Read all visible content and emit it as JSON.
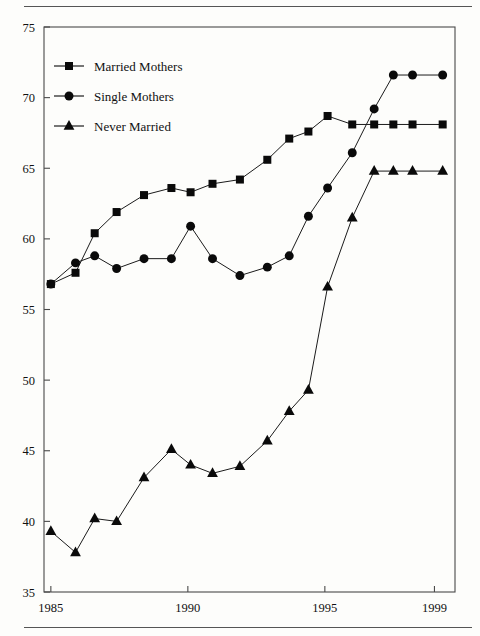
{
  "figure": {
    "top_rule": true,
    "bottom_rule": true,
    "caption": ""
  },
  "chart_data": {
    "type": "line",
    "title": "",
    "xlabel": "",
    "ylabel": "",
    "xlim": [
      1984.75,
      1999.75
    ],
    "ylim": [
      35,
      75
    ],
    "ytick_values": [
      35,
      40,
      45,
      50,
      55,
      60,
      65,
      70,
      75
    ],
    "ytick_labels": [
      "35",
      "40",
      "45",
      "50",
      "55",
      "60",
      "65",
      "70",
      "75"
    ],
    "xtick_values": [
      1985,
      1990,
      1995,
      1999
    ],
    "xtick_labels": [
      "1985",
      "1990",
      "1995",
      "1999"
    ],
    "grid": false,
    "legend_position": "upper-left",
    "series": [
      {
        "name": "Married Mothers",
        "marker": "square",
        "x": [
          1985.0,
          1985.9,
          1986.6,
          1987.4,
          1988.4,
          1989.4,
          1990.1,
          1990.9,
          1991.9,
          1992.9,
          1993.7,
          1994.4,
          1995.1,
          1996.0,
          1996.8,
          1997.5,
          1998.2,
          1999.3
        ],
        "values": [
          56.8,
          57.6,
          60.4,
          61.9,
          63.1,
          63.6,
          63.3,
          63.9,
          64.2,
          65.6,
          67.1,
          67.6,
          68.7,
          68.1,
          68.1,
          68.1,
          68.1,
          68.1
        ]
      },
      {
        "name": "Single Mothers",
        "marker": "circle",
        "x": [
          1985.0,
          1985.9,
          1986.6,
          1987.4,
          1988.4,
          1989.4,
          1990.1,
          1990.9,
          1991.9,
          1992.9,
          1993.7,
          1994.4,
          1995.1,
          1996.0,
          1996.8,
          1997.5,
          1998.2,
          1999.3
        ],
        "values": [
          56.8,
          58.3,
          58.8,
          57.9,
          58.6,
          58.6,
          60.9,
          58.6,
          57.4,
          58.0,
          58.8,
          61.6,
          63.6,
          66.1,
          69.2,
          71.6,
          71.6,
          71.6
        ]
      },
      {
        "name": "Never Married",
        "marker": "triangle",
        "x": [
          1985.0,
          1985.9,
          1986.6,
          1987.4,
          1988.4,
          1989.4,
          1990.1,
          1990.9,
          1991.9,
          1992.9,
          1993.7,
          1994.4,
          1995.1,
          1996.0,
          1996.8,
          1997.5,
          1998.2,
          1999.3
        ],
        "values": [
          39.3,
          37.8,
          40.2,
          40.0,
          43.1,
          45.1,
          44.0,
          43.4,
          43.9,
          45.7,
          47.8,
          49.3,
          56.6,
          61.5,
          64.8,
          64.8,
          64.8,
          64.8
        ]
      }
    ]
  },
  "legend": {
    "items": [
      {
        "label": "Married Mothers",
        "marker": "square"
      },
      {
        "label": "Single Mothers",
        "marker": "circle"
      },
      {
        "label": "Never Married",
        "marker": "triangle"
      }
    ]
  }
}
